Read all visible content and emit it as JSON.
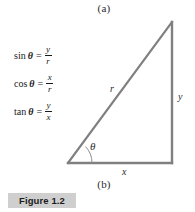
{
  "figure": {
    "caption": "Figure 1.2",
    "panel_label_top": "(a)",
    "panel_label_bottom": "(b)",
    "line_color": "#808080",
    "caption_box_color": "#cfcfcf",
    "text_color": "#1a1a1a"
  },
  "formulas": [
    {
      "name": "sin",
      "angle": "θ",
      "equals": "=",
      "numerator": "y",
      "denominator": "r"
    },
    {
      "name": "cos",
      "angle": "θ",
      "equals": "=",
      "numerator": "x",
      "denominator": "r"
    },
    {
      "name": "tan",
      "angle": "θ",
      "equals": "=",
      "numerator": "y",
      "denominator": "x"
    }
  ],
  "triangle": {
    "hypotenuse_label": "r",
    "vertical_label": "y",
    "base_label": "x",
    "angle_label": "θ",
    "vertices": {
      "origin": [
        68,
        163
      ],
      "right_corner": [
        172,
        163
      ],
      "apex": [
        172,
        22
      ]
    },
    "angle_arc_radius": 24
  }
}
